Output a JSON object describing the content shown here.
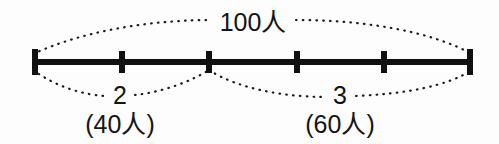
{
  "diagram": {
    "type": "number-line-ratio-diagram",
    "canvas": {
      "width": 499,
      "height": 144,
      "background": "#fdfdfd"
    },
    "line_color": "#111111",
    "brace_color": "#1a1a1a",
    "axis": {
      "y": 62,
      "x_start": 33,
      "x_end": 472,
      "segment_count": 5,
      "tick_positions": [
        33,
        122,
        209,
        297,
        384,
        472
      ]
    },
    "total_label": {
      "text": "100人",
      "x": 253,
      "y": 20,
      "brace_from": 33,
      "brace_to": 472,
      "brace_side": "top"
    },
    "parts": [
      {
        "ratio_label": "2",
        "count_label": "(40人)",
        "ratio_x": 120,
        "ratio_y": 95,
        "count_x": 120,
        "count_y": 122,
        "brace_from": 33,
        "brace_to": 209,
        "brace_side": "bottom",
        "segments": 2
      },
      {
        "ratio_label": "3",
        "count_label": "(60人)",
        "ratio_x": 340,
        "ratio_y": 95,
        "count_x": 340,
        "count_y": 122,
        "brace_from": 209,
        "brace_to": 472,
        "brace_side": "bottom",
        "segments": 3
      }
    ]
  }
}
